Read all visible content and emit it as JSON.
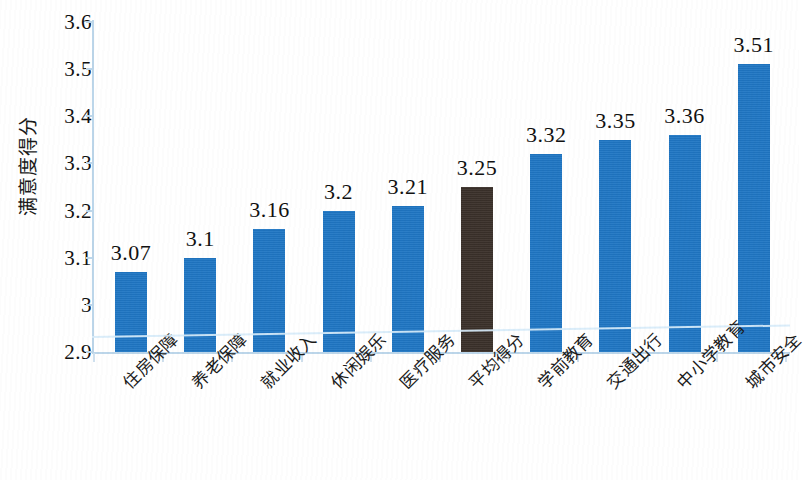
{
  "chart_data": {
    "type": "bar",
    "title": "",
    "xlabel": "",
    "ylabel": "满意度得分",
    "ylim": [
      2.9,
      3.6
    ],
    "ytick_labels": [
      "3.6",
      "3.5",
      "3.4",
      "3.3",
      "3.2",
      "3.1",
      "3",
      "2.9"
    ],
    "ytick_values": [
      3.6,
      3.5,
      3.4,
      3.3,
      3.2,
      3.1,
      3.0,
      2.9
    ],
    "grid": false,
    "legend": "none",
    "categories": [
      "住房保障",
      "养老保障",
      "就业收入",
      "休闲娱乐",
      "医疗服务",
      "平均得分",
      "学前教育",
      "交通出行",
      "中小学教育",
      "城市安全"
    ],
    "values": [
      3.07,
      3.1,
      3.16,
      3.2,
      3.21,
      3.25,
      3.32,
      3.35,
      3.36,
      3.51
    ],
    "value_labels": [
      "3.07",
      "3.1",
      "3.16",
      "3.2",
      "3.21",
      "3.25",
      "3.32",
      "3.35",
      "3.36",
      "3.51"
    ],
    "bar_colors": [
      "#1f76c4",
      "#1f76c4",
      "#1f76c4",
      "#1f76c4",
      "#1f76c4",
      "#3a3029",
      "#1f76c4",
      "#1f76c4",
      "#1f76c4",
      "#1f76c4"
    ],
    "highlighted_index": 5,
    "series_color": "#1f76c4",
    "average_color": "#3a3029",
    "axis_color": "#bcd6ea"
  }
}
